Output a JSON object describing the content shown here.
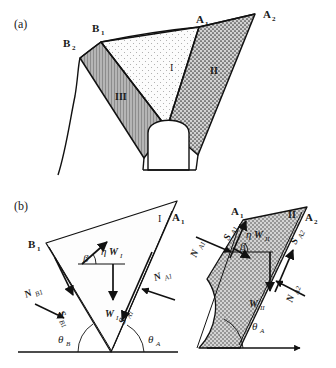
{
  "figure": {
    "caption_a": "(a)",
    "caption_b": "(b)",
    "type": "engineering-diagram"
  },
  "panel_a": {
    "label": "(a)",
    "vertex_labels": [
      {
        "name": "B2",
        "text": "B",
        "sub": "2"
      },
      {
        "name": "B1",
        "text": "B",
        "sub": "1"
      },
      {
        "name": "A1",
        "text": "A",
        "sub": "1"
      },
      {
        "name": "A2",
        "text": "A",
        "sub": "2"
      }
    ],
    "region_labels": [
      {
        "name": "region-I",
        "text": "I"
      },
      {
        "name": "region-II",
        "text": "II"
      },
      {
        "name": "region-III",
        "text": "III"
      }
    ],
    "colors": {
      "region_I_fill": "#fbfbfb",
      "region_II_fill": "#c9c9c9",
      "region_III_fill": "#a8a8a8",
      "outline": "#111111",
      "ground_line": "#111111"
    }
  },
  "panel_b": {
    "label": "(b)",
    "left_block": {
      "name": "free-body-block-I",
      "region": "I",
      "vertices": [
        {
          "name": "B1",
          "text": "B",
          "sub": "1"
        },
        {
          "name": "A1",
          "text": "A",
          "sub": "1"
        }
      ],
      "forces": [
        {
          "name": "eta-W-I",
          "text": "ηW",
          "sub": "I",
          "desc": "seismic force up-slope"
        },
        {
          "name": "W-I",
          "text": "W",
          "sub": "I",
          "desc": "weight of block I"
        },
        {
          "name": "N-B1",
          "text": "N",
          "sub": "B1",
          "desc": "normal force on plane B1"
        },
        {
          "name": "S-B1",
          "text": "S",
          "sub": "B1",
          "desc": "shear force on plane B1"
        },
        {
          "name": "N-A1",
          "text": "N",
          "sub": "A1",
          "desc": "normal force on plane A1"
        },
        {
          "name": "S-A1",
          "text": "S",
          "sub": "A1",
          "desc": "shear force on plane A1"
        }
      ],
      "angles": [
        {
          "name": "beta",
          "text": "β"
        },
        {
          "name": "theta-B",
          "text": "θ",
          "sub": "B"
        },
        {
          "name": "theta-A",
          "text": "θ",
          "sub": "A"
        }
      ]
    },
    "right_block": {
      "name": "free-body-block-II",
      "region": "II",
      "vertices": [
        {
          "name": "A1",
          "text": "A",
          "sub": "1"
        },
        {
          "name": "A2",
          "text": "A",
          "sub": "2"
        }
      ],
      "region_label": {
        "name": "region-II",
        "text": "II"
      },
      "forces": [
        {
          "name": "eta-W-II",
          "text": "ηW",
          "sub": "II",
          "desc": "seismic force up-slope"
        },
        {
          "name": "W-II",
          "text": "W",
          "sub": "II",
          "desc": "weight of block II"
        },
        {
          "name": "N-A1",
          "text": "N",
          "sub": "A1",
          "desc": "normal force on plane A1"
        },
        {
          "name": "S-A1",
          "text": "S",
          "sub": "A1",
          "desc": "shear force on plane A1"
        },
        {
          "name": "N-A2",
          "text": "N",
          "sub": "A2",
          "desc": "normal force on plane A2"
        },
        {
          "name": "S-A2",
          "text": "S",
          "sub": "A2",
          "desc": "shear force on plane A2"
        }
      ],
      "angles": [
        {
          "name": "beta",
          "text": "β"
        },
        {
          "name": "theta-A",
          "text": "θ",
          "sub": "A"
        }
      ],
      "fill": "#c9c9c9"
    }
  }
}
